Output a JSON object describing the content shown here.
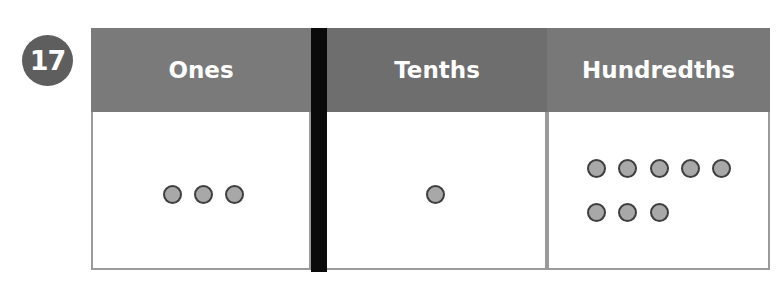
{
  "problem": {
    "number": "17"
  },
  "table": {
    "columns": [
      {
        "header": "Ones",
        "dots": 3,
        "header_color": "#7a7a7a"
      },
      {
        "header": "Tenths",
        "dots": 1,
        "header_color": "#6e6e6e"
      },
      {
        "header": "Hundredths",
        "dots": 8,
        "header_color": "#787878"
      }
    ]
  },
  "colors": {
    "dot_fill": "#a8a8a8",
    "dot_stroke": "#3e3e3e",
    "divider": "#0a0a0a",
    "border": "#9a9a9a"
  }
}
